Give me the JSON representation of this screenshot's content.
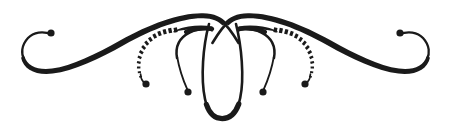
{
  "image": {
    "kind": "decorative-flourish-ornament",
    "title": "Calligraphic Divider Flourish",
    "width": 451,
    "height": 129,
    "background_color": "#ffffff",
    "ink_color": "#1a1a1a",
    "symmetry": "bilateral-mirror-about-vertical-center",
    "center_x": 225.5
  },
  "ornament": {
    "strokes": [
      {
        "name": "left-outer-swash",
        "role": "main sweeping S-curve from left spiral curl up to center crossing",
        "style": "solid tapered",
        "max_width_px": 6,
        "min_width_px": 1.2
      },
      {
        "name": "right-outer-swash",
        "role": "mirrored main sweeping S-curve from right spiral curl up to center crossing",
        "style": "solid tapered",
        "max_width_px": 6,
        "min_width_px": 1.2
      },
      {
        "name": "left-spiral-curl",
        "role": "open C spiral terminal at far left end",
        "style": "solid thin",
        "terminal": "ball"
      },
      {
        "name": "right-spiral-curl",
        "role": "open C spiral terminal at far right end",
        "style": "solid thin",
        "terminal": "ball"
      },
      {
        "name": "left-dashed-arc",
        "role": "outer dotted/ticked arc descending to a ball terminal",
        "style": "dashed tapered ticks",
        "tick_count": 14,
        "terminal": "ball"
      },
      {
        "name": "right-dashed-arc",
        "role": "mirrored outer dotted/ticked arc descending to a ball terminal",
        "style": "dashed tapered ticks",
        "tick_count": 14,
        "terminal": "ball"
      },
      {
        "name": "left-inner-arc",
        "role": "solid inner arc tapering from thick top to thin ball terminal",
        "style": "solid tapered",
        "terminal": "ball"
      },
      {
        "name": "right-inner-arc",
        "role": "mirrored solid inner arc tapering from thick top to thin ball terminal",
        "style": "solid tapered",
        "terminal": "ball"
      },
      {
        "name": "center-teardrop-loop",
        "role": "pointed oval loop descending from center crossing, thickened at base",
        "style": "solid closed loop"
      }
    ],
    "ball_terminals": [
      {
        "name": "left-curl-ball",
        "x": 51,
        "y": 33,
        "r": 3.6
      },
      {
        "name": "right-curl-ball",
        "x": 400,
        "y": 33,
        "r": 3.6
      },
      {
        "name": "left-dashed-arc-ball",
        "x": 146,
        "y": 84,
        "r": 3.6
      },
      {
        "name": "right-dashed-arc-ball",
        "x": 305,
        "y": 84,
        "r": 3.6
      },
      {
        "name": "left-inner-arc-ball",
        "x": 188,
        "y": 92,
        "r": 3.6
      },
      {
        "name": "right-inner-arc-ball",
        "x": 263,
        "y": 92,
        "r": 3.6
      }
    ],
    "key_points": {
      "crossing_x": 225.5,
      "crossing_y": 22,
      "swash_peak_y": 13,
      "loop_bottom_y": 118,
      "curl_bottom_y": 68
    }
  }
}
